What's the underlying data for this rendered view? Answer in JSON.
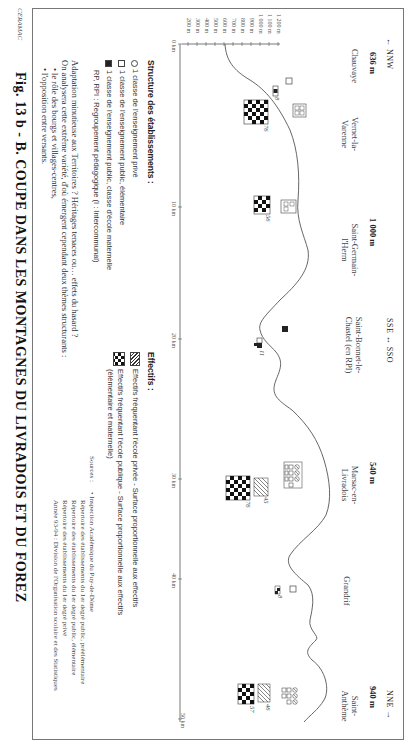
{
  "figure": {
    "title": "Fig. 13 b - B. COUPE DANS LES MONTAGNES DU LIVRADOIS ET DU FOREZ",
    "credit": "CERAMAC"
  },
  "profile": {
    "directions": {
      "left": "← NNW",
      "middle": "SSE ↔ SSO",
      "right": "NNE →"
    },
    "altitude_markers": [
      {
        "label": "636 m",
        "km": 1.5
      },
      {
        "label": "1 000 m",
        "km": 14
      },
      {
        "label": "540 m",
        "km": 33
      },
      {
        "label": "940 m",
        "km": 47.5
      }
    ],
    "villages": [
      {
        "name": "Chauvaye",
        "km": 1.5
      },
      {
        "name": "Vernet-la-Varenne",
        "km": 7
      },
      {
        "name": "Saint-Germain-l'Herm",
        "km": 14
      },
      {
        "name": "Saint-Bonnet-le-Chastel (en RPI)",
        "km": 22.5
      },
      {
        "name": "Marsac-en-Livradois",
        "km": 33
      },
      {
        "name": "Grandrif",
        "km": 39
      },
      {
        "name": "Saint-Anthème",
        "km": 47.5
      }
    ],
    "y_axis": {
      "ticks": [
        "1 200 m",
        "1 100 m",
        "1 000 m",
        "900 m",
        "800 m",
        "700 m",
        "600 m",
        "500 m",
        "400 m",
        "300 m",
        "200 m"
      ]
    },
    "x_axis": {
      "ticks": [
        "0 km",
        "10 km",
        "20 km",
        "30 km",
        "40 km",
        "50 km"
      ]
    },
    "schools": [
      {
        "village": "Chauvaye",
        "effectif": "8"
      },
      {
        "village": "Vernet-la-Varenne",
        "effectif": "76"
      },
      {
        "village": "Saint-Germain-l'Herm",
        "effectif": "56"
      },
      {
        "village": "Saint-Bonnet-le-Chastel",
        "effectif": "11"
      },
      {
        "village": "Marsac-en-Livradois",
        "effectif_prive": "45",
        "effectif_public": "76"
      },
      {
        "village": "Grandrif",
        "effectif": "8"
      },
      {
        "village": "Saint-Anthème",
        "effectif_prive": "46",
        "effectif_public": "57"
      }
    ]
  },
  "legend": {
    "structure_title": "Structure des établissements :",
    "structure_items": [
      {
        "symbol": "hatched-circle",
        "label": "1 classe de l'enseignement privé"
      },
      {
        "symbol": "empty-square",
        "label": "1 classe de l'enseignement public, élémentaire"
      },
      {
        "symbol": "filled-square",
        "label": "1 classe de l'enseignement public, classe d'école maternelle"
      },
      {
        "symbol": "none",
        "label": "RP, RPI : Regroupement pédagogique (I : Intercommunal)"
      }
    ],
    "effectifs_title": "Effectifs :",
    "effectifs_items": [
      {
        "symbol": "hatched-block",
        "label": "Effectifs fréquentant l'école privée - Surface proportionnelle aux effectifs"
      },
      {
        "symbol": "checker-block",
        "label": "Effectifs fréquentant l'école publique - Surface proportionnelle aux effectifs",
        "label2": "(élémentaire et maternelle)"
      }
    ]
  },
  "commentary": {
    "line1": "Adaptation minutieuse aux Territoires ? Héritages tenaces ou… effets du hasard ?",
    "line2": "On analysera cette extrême variété, d'où émergent cependant deux thèmes structurants :",
    "bullets": [
      "• le rôle des bourgs et villages-centres,",
      "• l'opposition entre versants."
    ]
  },
  "sources": {
    "label": "Sources :",
    "lines": [
      "• Inspection Académique du Puy-de-Dôme",
      "Répertoire des établissements du 1er degré public, préélémentaire",
      "Répertoire des établissements du 1er degré public, élémentaire",
      "Répertoire des établissements du 1er degré privé",
      "Année 93-94 : Division de l'Organisation scolaire et des Statistiques"
    ]
  }
}
